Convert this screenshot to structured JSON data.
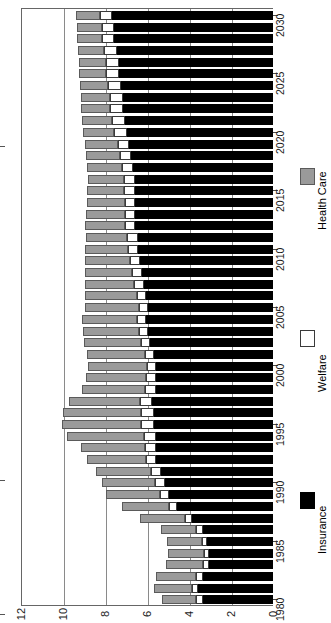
{
  "chart_data": {
    "type": "bar",
    "subtype": "stacked-horizontal-rotated",
    "title": "",
    "xlabel": "",
    "ylabel": "",
    "orientation": "rotated-90",
    "grid": true,
    "legend_position": "right",
    "value_axis": {
      "ticks": [
        "12",
        "10",
        "8",
        "6",
        "4",
        "2",
        "0"
      ],
      "min": 0,
      "max": 12,
      "direction": "right-to-left"
    },
    "category_axis": {
      "ticks": [
        "1980",
        "1985",
        "1990",
        "1995",
        "2000",
        "2005",
        "2010",
        "2015",
        "2020",
        "2025",
        "2030"
      ],
      "direction": "bottom-to-top"
    },
    "categories": [
      1980,
      1981,
      1982,
      1983,
      1984,
      1985,
      1986,
      1987,
      1988,
      1989,
      1990,
      1991,
      1992,
      1993,
      1994,
      1995,
      1996,
      1997,
      1998,
      1999,
      2000,
      2001,
      2002,
      2003,
      2004,
      2005,
      2006,
      2007,
      2008,
      2009,
      2010,
      2011,
      2012,
      2013,
      2014,
      2015,
      2016,
      2017,
      2018,
      2019,
      2020,
      2021,
      2022,
      2023,
      2024,
      2025,
      2026,
      2027,
      2028,
      2029,
      2030
    ],
    "series": [
      {
        "name": "Insurance",
        "color": "#000000",
        "values": [
          3.35,
          3.55,
          3.35,
          3.05,
          3.05,
          3.15,
          3.35,
          3.85,
          4.55,
          4.95,
          5.15,
          5.35,
          5.55,
          5.55,
          5.55,
          5.65,
          5.65,
          5.75,
          5.55,
          5.55,
          5.55,
          5.65,
          5.85,
          5.95,
          6.05,
          5.95,
          6.05,
          6.15,
          6.25,
          6.35,
          6.45,
          6.45,
          6.55,
          6.55,
          6.55,
          6.55,
          6.55,
          6.65,
          6.75,
          6.85,
          6.95,
          7.05,
          7.15,
          7.15,
          7.25,
          7.35,
          7.35,
          7.45,
          7.55,
          7.55,
          7.65
        ]
      },
      {
        "name": "Welfare",
        "color": "#ffffff",
        "values": [
          0.3,
          0.3,
          0.3,
          0.3,
          0.25,
          0.25,
          0.3,
          0.35,
          0.4,
          0.45,
          0.45,
          0.45,
          0.5,
          0.55,
          0.6,
          0.65,
          0.65,
          0.6,
          0.55,
          0.5,
          0.45,
          0.45,
          0.45,
          0.45,
          0.45,
          0.45,
          0.45,
          0.45,
          0.45,
          0.45,
          0.45,
          0.5,
          0.5,
          0.5,
          0.5,
          0.55,
          0.55,
          0.55,
          0.55,
          0.55,
          0.6,
          0.6,
          0.6,
          0.6,
          0.6,
          0.6,
          0.6,
          0.6,
          0.6,
          0.6,
          0.6
        ]
      },
      {
        "name": "Health Care",
        "color": "#9a9a9a",
        "values": [
          1.65,
          1.8,
          1.9,
          1.75,
          1.7,
          1.65,
          1.7,
          2.15,
          2.25,
          2.55,
          2.55,
          2.65,
          2.8,
          3.05,
          3.65,
          3.75,
          3.7,
          3.35,
          3.0,
          2.85,
          2.8,
          2.75,
          2.7,
          2.65,
          2.6,
          2.55,
          2.45,
          2.35,
          2.25,
          2.15,
          2.05,
          1.95,
          1.9,
          1.85,
          1.8,
          1.75,
          1.7,
          1.65,
          1.6,
          1.55,
          1.5,
          1.45,
          1.4,
          1.4,
          1.35,
          1.3,
          1.3,
          1.25,
          1.2,
          1.2,
          1.15
        ]
      }
    ],
    "legend": [
      {
        "label": "Health Care",
        "color": "#9a9a9a"
      },
      {
        "label": "Welfare",
        "color": "#ffffff"
      },
      {
        "label": "Insurance",
        "color": "#000000"
      }
    ]
  }
}
